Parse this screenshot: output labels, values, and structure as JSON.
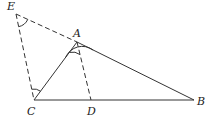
{
  "diagram": {
    "type": "geometry",
    "stroke_color": "#333333",
    "points": {
      "E": {
        "label": "E",
        "x": 16,
        "y": 14
      },
      "A": {
        "label": "A",
        "x": 77,
        "y": 42
      },
      "C": {
        "label": "C",
        "x": 34,
        "y": 100
      },
      "D": {
        "label": "D",
        "x": 91,
        "y": 100
      },
      "B": {
        "label": "B",
        "x": 194,
        "y": 100
      }
    },
    "segments": [
      {
        "from": "E",
        "to": "A",
        "style": "dashed"
      },
      {
        "from": "A",
        "to": "B",
        "style": "solid"
      },
      {
        "from": "E",
        "to": "C",
        "style": "dashed"
      },
      {
        "from": "C",
        "to": "A",
        "style": "solid"
      },
      {
        "from": "A",
        "to": "D",
        "style": "dashed"
      },
      {
        "from": "C",
        "to": "B",
        "style": "solid"
      }
    ],
    "angle_marks": [
      "angle at E",
      "angle CAD",
      "angle DAE-side at A",
      "angle ECA at C"
    ]
  }
}
